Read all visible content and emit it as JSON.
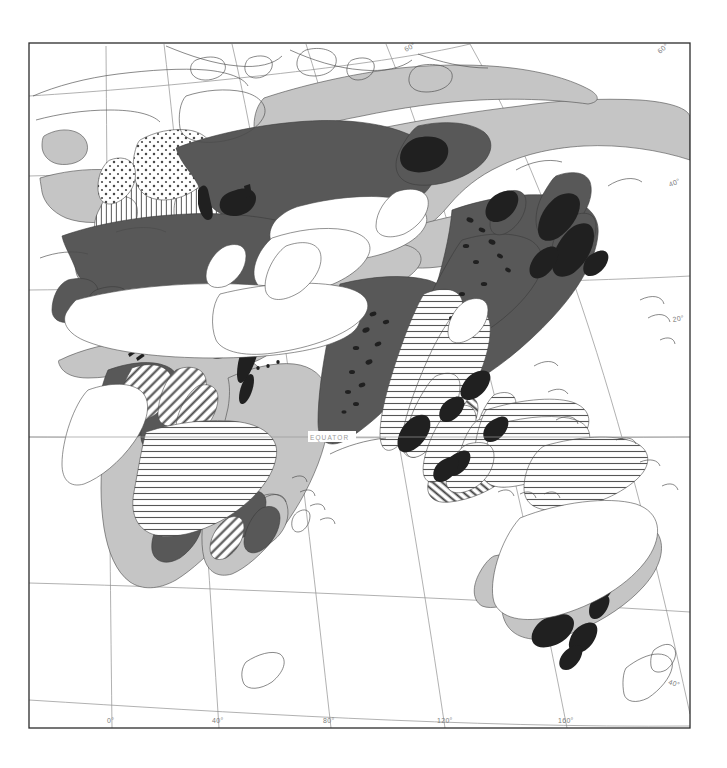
{
  "map": {
    "title": "Population density map of Eurasia, Africa and Australia",
    "projection_note": "curved graticule world map, eastern hemisphere",
    "equator_label": "EQUATOR",
    "frame": {
      "x": 29,
      "y": 43,
      "width": 661,
      "height": 685
    },
    "background_color": "#ffffff",
    "frame_color": "#2b2b2b",
    "graticule_color": "#8f8f8f",
    "coastline_color": "#4a4a4a",
    "longitude_labels": [
      {
        "text": "0°",
        "x": 112,
        "y": 722
      },
      {
        "text": "40°",
        "x": 217,
        "y": 722
      },
      {
        "text": "80°",
        "x": 329,
        "y": 722
      },
      {
        "text": "120°",
        "x": 443,
        "y": 722
      },
      {
        "text": "160°",
        "x": 565,
        "y": 722
      }
    ],
    "latitude_labels": [
      {
        "text": "60°",
        "x": 413,
        "y": 50,
        "rotate": -30
      },
      {
        "text": "60°",
        "x": 668,
        "y": 50,
        "rotate": -40
      },
      {
        "text": "40°",
        "x": 678,
        "y": 184,
        "rotate": -22
      },
      {
        "text": "20°",
        "x": 680,
        "y": 320,
        "rotate": -10
      },
      {
        "text": "40°",
        "x": 678,
        "y": 683,
        "rotate": 18
      }
    ],
    "legend_classes": [
      {
        "name": "very-high-density",
        "fill": "#3a3a3a",
        "description": "black – highest density cores"
      },
      {
        "name": "high-density",
        "fill": "#585858",
        "description": "dark grey – high density"
      },
      {
        "name": "moderate-density",
        "fill": "#c5c5c5",
        "description": "light grey – moderate density"
      },
      {
        "name": "low-density",
        "fill": "#ffffff",
        "description": "white – sparse / desert"
      },
      {
        "name": "hatch-horizontal",
        "fill": "horizontal-lines",
        "description": "tropical belt hatching"
      },
      {
        "name": "hatch-vertical",
        "fill": "vertical-lines",
        "description": "temperate belt hatching"
      },
      {
        "name": "hatch-diagonal",
        "fill": "diagonal-lines",
        "description": "intermediate belt hatching"
      },
      {
        "name": "stipple",
        "fill": "dots",
        "description": "stippled – boreal / Fennoscandia"
      }
    ],
    "regions": [
      "Iceland",
      "British Isles",
      "Scandinavia",
      "Western Europe",
      "Central Europe",
      "Mediterranean",
      "European Russia",
      "Siberia",
      "Central Asia",
      "Arabian Peninsula",
      "Sahara",
      "Sahel",
      "Congo Basin",
      "East Africa",
      "Southern Africa",
      "Madagascar",
      "India",
      "Indochina",
      "China",
      "Korea",
      "Japan",
      "Philippines",
      "Sumatra",
      "Borneo",
      "Java",
      "New Guinea",
      "Australia",
      "New Zealand"
    ]
  }
}
